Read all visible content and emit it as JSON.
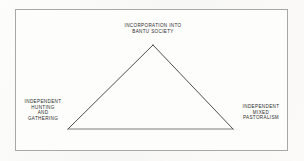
{
  "figure": {
    "type": "triangle-relationship-diagram",
    "border_color": "#a8a8a4",
    "line_color": "#3a3a3a",
    "text_color": "#2b2b2b",
    "background_color": "#fdfdfc",
    "vertices": {
      "apex": {
        "id": "incorporation",
        "label": "INCORPORATION INTO\nBANTU SOCIETY",
        "x": 153,
        "y": 45
      },
      "bottom_left": {
        "id": "hunting-gathering",
        "label": "INDEPENDENT\nHUNTING\nAND\nGATHERING",
        "x": 68,
        "y": 129
      },
      "bottom_right": {
        "id": "mixed-pastoralism",
        "label": "INDEPENDENT\nMIXED\nPASTORALISM",
        "x": 233,
        "y": 129
      }
    },
    "edges": [
      {
        "from": "hunting-gathering",
        "to": "incorporation"
      },
      {
        "from": "incorporation",
        "to": "mixed-pastoralism"
      },
      {
        "from": "hunting-gathering",
        "to": "mixed-pastoralism"
      }
    ]
  }
}
